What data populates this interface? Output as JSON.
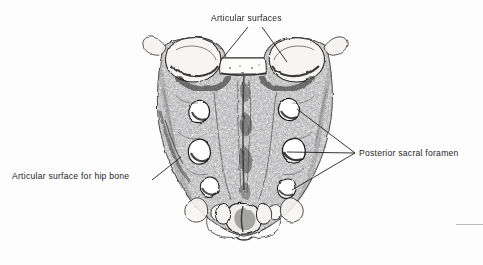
{
  "figure": {
    "view": "posterior",
    "background_color": "#fdfdfd",
    "ink_color": "#1d1d1d",
    "width": 483,
    "height": 265
  },
  "labels": {
    "articular_surfaces": "Articular surfaces",
    "posterior_sacral_foramen": "Posterior sacral foramen",
    "articular_surface_for_hip_bone": "Articular surface for hip bone"
  },
  "leaders": {
    "articular_surfaces_left": {
      "x1": 248,
      "y1": 27,
      "x2": 222,
      "y2": 59
    },
    "articular_surfaces_right": {
      "x1": 262,
      "y1": 27,
      "x2": 287,
      "y2": 62
    },
    "foramen_upper": {
      "x1": 355,
      "y1": 153,
      "x2": 297,
      "y2": 109
    },
    "foramen_middle": {
      "x1": 355,
      "y1": 153,
      "x2": 287,
      "y2": 152
    },
    "foramen_lower": {
      "x1": 355,
      "y1": 153,
      "x2": 292,
      "y2": 190
    },
    "hip_bone": {
      "x1": 152,
      "y1": 180,
      "x2": 181,
      "y2": 157
    }
  },
  "anatomy": {
    "structures": [
      "superior articular process (left)",
      "superior articular process (right)",
      "sacral canal opening",
      "median sacral crest",
      "posterior sacral foramina",
      "auricular (articular) surface for hip bone",
      "sacral hiatus",
      "sacral cornu",
      "apex of sacrum"
    ],
    "foramina_pairs": 4
  },
  "page_rule": {
    "color": "#b9b9b9"
  }
}
